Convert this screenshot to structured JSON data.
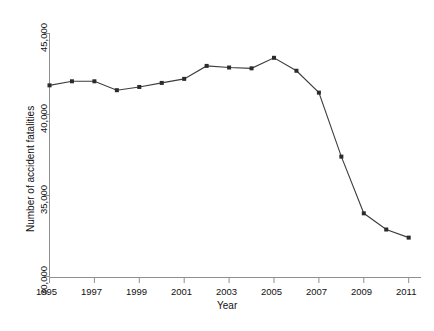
{
  "chart_data": {
    "type": "line",
    "title": "",
    "subtitle": "",
    "xlabel": "Year",
    "ylabel": "Number of accident fatalities",
    "x": [
      1995,
      1996,
      1997,
      1998,
      1999,
      2000,
      2001,
      2002,
      2003,
      2004,
      2005,
      2006,
      2007,
      2008,
      2009,
      2010,
      2011
    ],
    "values": [
      41800,
      42050,
      42050,
      41500,
      41700,
      41950,
      42200,
      43000,
      42900,
      42850,
      43500,
      42700,
      41350,
      37400,
      33900,
      32900,
      32400
    ],
    "series": [
      {
        "name": "Number of accident fatalities",
        "values": [
          41800,
          42050,
          42050,
          41500,
          41700,
          41950,
          42200,
          43000,
          42900,
          42850,
          43500,
          42700,
          41350,
          37400,
          33900,
          32900,
          32400
        ]
      }
    ],
    "xlim": [
      1995,
      2011
    ],
    "ylim": [
      30000,
      45000
    ],
    "xticks": [
      1995,
      1997,
      1999,
      2001,
      2003,
      2005,
      2007,
      2009,
      2011
    ],
    "xticklabels": [
      "1995",
      "1997",
      "1999",
      "2001",
      "2003",
      "2005",
      "2007",
      "2009",
      "2011"
    ],
    "yticks": [
      30000,
      35000,
      40000,
      45000
    ],
    "yticklabels": [
      "30,000",
      "35,000",
      "40,000",
      "45,000"
    ],
    "grid": false,
    "legend": false,
    "legend_position": "none",
    "marker": "filled-square",
    "line_color": "#3d3d3d",
    "marker_color": "#2b2b2b",
    "axis_color": "#9a9a9a",
    "background_color": "#ffffff"
  },
  "axes": {
    "x_title": "Year",
    "y_title": "Number of accident fatalities"
  },
  "ticks": {
    "y": [
      {
        "label": "45,000"
      },
      {
        "label": "40,000"
      },
      {
        "label": "35,000"
      },
      {
        "label": "30,000"
      }
    ],
    "x": [
      {
        "label": "1995"
      },
      {
        "label": "1997"
      },
      {
        "label": "1999"
      },
      {
        "label": "2001"
      },
      {
        "label": "2003"
      },
      {
        "label": "2005"
      },
      {
        "label": "2007"
      },
      {
        "label": "2009"
      },
      {
        "label": "2011"
      }
    ]
  }
}
